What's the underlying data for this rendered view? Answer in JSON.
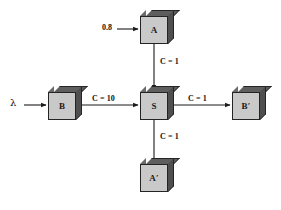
{
  "diagram": {
    "background_color": "#ffffff",
    "node_face_color": "#c9c9c9",
    "node_edge_color": "#242424",
    "node_shadow_color": "#5e5e5e",
    "line_color": "#1a1a1a",
    "nodes": [
      {
        "id": "A",
        "label": "A",
        "x": 140,
        "y": 10,
        "role": "top-source-node"
      },
      {
        "id": "B",
        "label": "B",
        "x": 48,
        "y": 86,
        "role": "left-source-node"
      },
      {
        "id": "S",
        "label": "S",
        "x": 140,
        "y": 86,
        "role": "center-switch-node"
      },
      {
        "id": "Bp",
        "label": "B′",
        "x": 232,
        "y": 86,
        "role": "right-sink-node"
      },
      {
        "id": "Ap",
        "label": "A′",
        "x": 140,
        "y": 158,
        "role": "bottom-sink-node"
      }
    ],
    "edges": [
      {
        "id": "A-to-S",
        "label": "C = 1",
        "from": "A",
        "to": "S",
        "direction": "down"
      },
      {
        "id": "B-to-S",
        "label": "C = 10",
        "from": "B",
        "to": "S",
        "direction": "right"
      },
      {
        "id": "S-to-Bp",
        "label": "C = 1",
        "from": "S",
        "to": "Bp",
        "direction": "right"
      },
      {
        "id": "S-to-Ap",
        "label": "C = 1",
        "from": "S",
        "to": "Ap",
        "direction": "down"
      }
    ],
    "inputs": [
      {
        "id": "rate-into-A",
        "label": "0.8",
        "target": "A",
        "direction": "right"
      },
      {
        "id": "rate-into-B",
        "label": "λ",
        "target": "B",
        "direction": "right"
      }
    ]
  }
}
